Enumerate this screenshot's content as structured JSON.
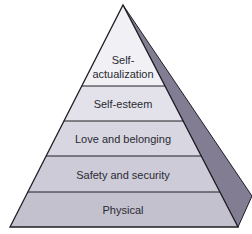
{
  "diagram": {
    "levels": [
      {
        "label_line1": "Self-",
        "label_line2": "actualization",
        "fill": "#f1f1f5"
      },
      {
        "label": "Self-esteem",
        "fill": "#e3e2ea"
      },
      {
        "label": "Love and belonging",
        "fill": "#d8d6e0"
      },
      {
        "label": "Safety and security",
        "fill": "#cdcbd7"
      },
      {
        "label": "Physical",
        "fill": "#c4c1cf"
      }
    ],
    "colors": {
      "side_face": "#837d94",
      "outline": "#1e1e24",
      "background": "#ffffff"
    }
  }
}
